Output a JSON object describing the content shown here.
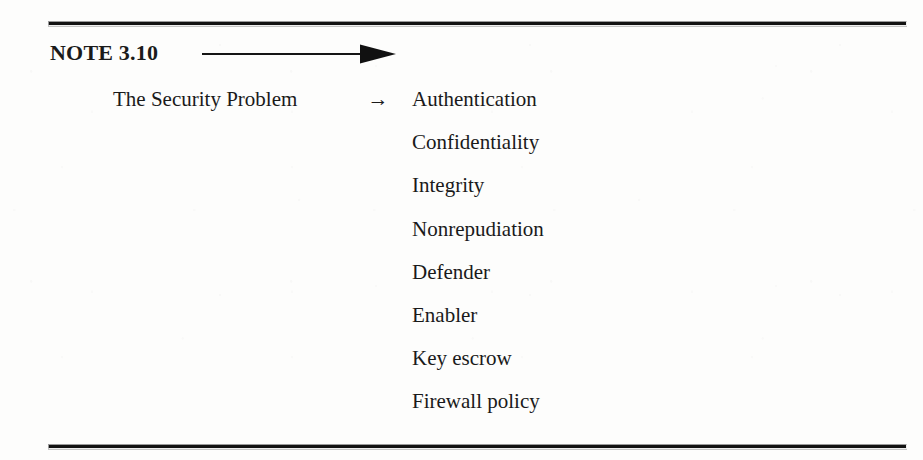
{
  "page": {
    "background_color": "#fdfdfc",
    "text_color": "#1a1a1a",
    "rule_color": "#121212"
  },
  "note": {
    "label": "NOTE 3.10",
    "arrow_icon": "long-right-arrow-icon"
  },
  "mapping": {
    "source": "The Security Problem",
    "arrow_glyph": "→",
    "arrow_icon": "right-arrow-icon",
    "targets": [
      "Authentication",
      "Confidentiality",
      "Integrity",
      "Nonrepudiation",
      "Defender",
      "Enabler",
      "Key escrow",
      "Firewall policy"
    ]
  }
}
